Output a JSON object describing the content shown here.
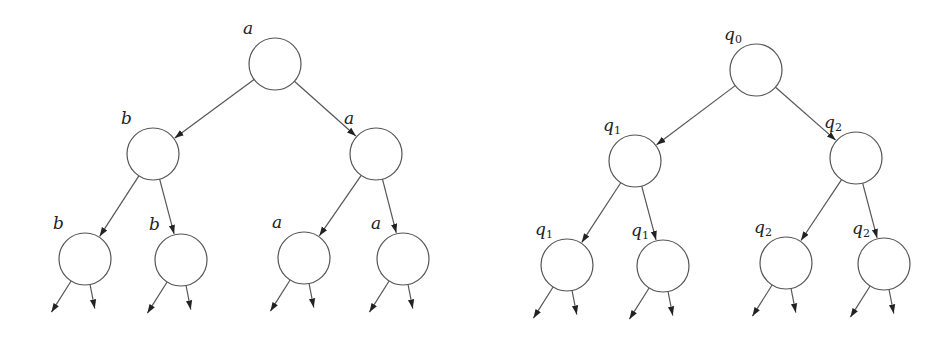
{
  "trees": [
    {
      "id": "left",
      "nodes": [
        {
          "label": "a",
          "sub": "",
          "x": 275,
          "y": 64
        },
        {
          "label": "b",
          "sub": "",
          "x": 153,
          "y": 154
        },
        {
          "label": "a",
          "sub": "",
          "x": 376,
          "y": 154
        },
        {
          "label": "b",
          "sub": "",
          "x": 85,
          "y": 259
        },
        {
          "label": "b",
          "sub": "",
          "x": 181,
          "y": 260
        },
        {
          "label": "a",
          "sub": "",
          "x": 304,
          "y": 258
        },
        {
          "label": "a",
          "sub": "",
          "x": 403,
          "y": 259
        }
      ]
    },
    {
      "id": "right",
      "nodes": [
        {
          "label": "q",
          "sub": "0",
          "x": 756,
          "y": 70
        },
        {
          "label": "q",
          "sub": "1",
          "x": 635,
          "y": 161
        },
        {
          "label": "q",
          "sub": "2",
          "x": 856,
          "y": 158
        },
        {
          "label": "q",
          "sub": "1",
          "x": 567,
          "y": 265
        },
        {
          "label": "q",
          "sub": "1",
          "x": 663,
          "y": 266
        },
        {
          "label": "q",
          "sub": "2",
          "x": 786,
          "y": 263
        },
        {
          "label": "q",
          "sub": "2",
          "x": 884,
          "y": 264
        }
      ]
    }
  ],
  "style": {
    "stroke": "#555555",
    "arrow": "#222222",
    "radius": 26
  }
}
